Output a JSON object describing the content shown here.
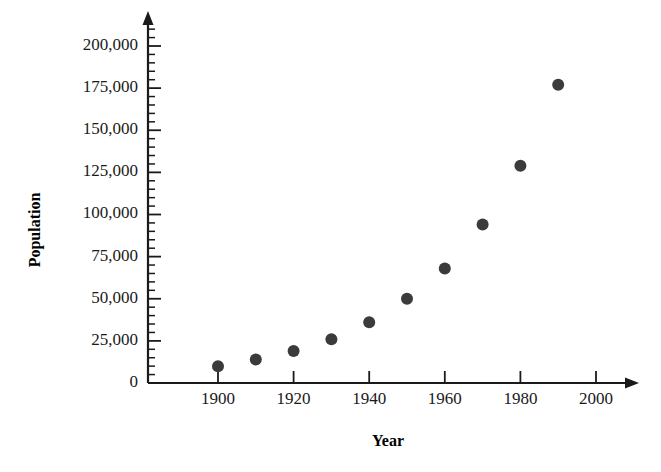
{
  "chart_data": {
    "type": "scatter",
    "title": "",
    "xlabel": "Year",
    "ylabel": "Population",
    "x": [
      1900,
      1910,
      1920,
      1930,
      1940,
      1950,
      1960,
      1970,
      1980,
      1990
    ],
    "values": [
      10000,
      14000,
      19000,
      26000,
      36000,
      50000,
      68000,
      94000,
      129000,
      177000
    ],
    "series": [
      {
        "name": "Population",
        "x": [
          1900,
          1910,
          1920,
          1930,
          1940,
          1950,
          1960,
          1970,
          1980,
          1990
        ],
        "values": [
          10000,
          14000,
          19000,
          26000,
          36000,
          50000,
          68000,
          94000,
          129000,
          177000
        ]
      }
    ],
    "xlim": [
      1886,
      2012
    ],
    "ylim": [
      0,
      207000
    ],
    "x_ticks": [
      1900,
      1920,
      1940,
      1960,
      1980,
      2000
    ],
    "x_tick_labels": [
      "1900",
      "1920",
      "1940",
      "1960",
      "1980",
      "2000"
    ],
    "x_minor_step": 10,
    "y_ticks": [
      0,
      25000,
      50000,
      75000,
      100000,
      125000,
      150000,
      175000,
      200000
    ],
    "y_tick_labels": [
      "0",
      "25,000",
      "50,000",
      "75,000",
      "100,000",
      "125,000",
      "150,000",
      "175,000",
      "200,000"
    ],
    "y_minor_step": 5000,
    "grid": false,
    "legend": null,
    "marker": {
      "shape": "circle",
      "radius": 6,
      "color": "#3b3b3b"
    },
    "axis_color": "#1a1a1a",
    "background_color": "#ffffff"
  }
}
